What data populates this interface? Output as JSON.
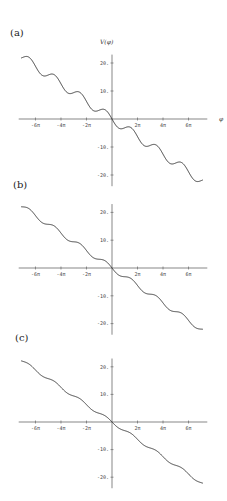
{
  "chart_data": [
    {
      "type": "line",
      "panel": "(a)",
      "title": "",
      "xlabel": "φ",
      "ylabel": "V(φ)",
      "xlim_pi": [
        -7,
        7
      ],
      "ylim": [
        -22,
        22
      ],
      "xticks": [
        "-6π",
        "-4π",
        "-2π",
        "2π",
        "4π",
        "6π"
      ],
      "xtick_values_pi": [
        -6,
        -4,
        -2,
        2,
        4,
        6
      ],
      "yticks": [
        20,
        10,
        -10,
        -20
      ],
      "ytick_labels": [
        "20.",
        "10.",
        "-10.",
        "-20."
      ],
      "grid": false,
      "function": "V(φ) = -φ - A·sin(φ)",
      "oscillation_amplitude": 1.6,
      "series": [
        {
          "name": "V(φ)",
          "x_range_pi": [
            -7,
            7
          ],
          "y_at_start": 22,
          "y_at_end": -22
        }
      ],
      "layout": {
        "origin_x": 112,
        "origin_y": 119,
        "px_per_rad": 4.06,
        "px_per_unit_y": 2.8,
        "label_x": 6,
        "label_y": 24,
        "ylabel_x": 100,
        "ylabel_y": 44
      }
    },
    {
      "type": "line",
      "panel": "(b)",
      "title": "",
      "xlabel": "",
      "ylabel": "",
      "xlim_pi": [
        -7,
        7
      ],
      "ylim": [
        -22,
        22
      ],
      "xticks": [
        "-6π",
        "-4π",
        "-2π",
        "2π",
        "4π",
        "6π"
      ],
      "xtick_values_pi": [
        -6,
        -4,
        -2,
        2,
        4,
        6
      ],
      "yticks": [
        20,
        10,
        -10,
        -20
      ],
      "ytick_labels": [
        "20.",
        "10.",
        "-10.",
        "-20."
      ],
      "grid": false,
      "function": "V(φ) = -φ - A·sin(φ)",
      "oscillation_amplitude": 0.9,
      "series": [
        {
          "name": "V(φ)",
          "x_range_pi": [
            -7,
            7
          ],
          "y_at_start": 22,
          "y_at_end": -22
        }
      ],
      "layout": {
        "origin_x": 112,
        "origin_y": 268,
        "px_per_rad": 4.06,
        "px_per_unit_y": 2.78,
        "label_x": 12,
        "label_y": 179
      }
    },
    {
      "type": "line",
      "panel": "(c)",
      "title": "",
      "xlabel": "",
      "ylabel": "",
      "xlim_pi": [
        -7,
        7
      ],
      "ylim": [
        -22,
        22
      ],
      "xticks": [
        "-6π",
        "-4π",
        "-2π",
        "2π",
        "4π",
        "6π"
      ],
      "xtick_values_pi": [
        -6,
        -4,
        -2,
        2,
        4,
        6
      ],
      "yticks": [
        20,
        10,
        -10,
        -20
      ],
      "ytick_labels": [
        "20.",
        "10.",
        "-10.",
        "-20."
      ],
      "grid": false,
      "function": "V(φ) = -φ - A·sin(φ)",
      "oscillation_amplitude": 0.55,
      "series": [
        {
          "name": "V(φ)",
          "x_range_pi": [
            -7,
            7
          ],
          "y_at_start": 22,
          "y_at_end": -22
        }
      ],
      "layout": {
        "origin_x": 112,
        "origin_y": 422,
        "px_per_rad": 4.06,
        "px_per_unit_y": 2.76,
        "label_x": 14,
        "label_y": 332
      }
    }
  ],
  "panels": {
    "a": {
      "label": "(a)"
    },
    "b": {
      "label": "(b)"
    },
    "c": {
      "label": "(c)"
    }
  },
  "axis_titles": {
    "y": "V(φ)",
    "x": "φ"
  }
}
